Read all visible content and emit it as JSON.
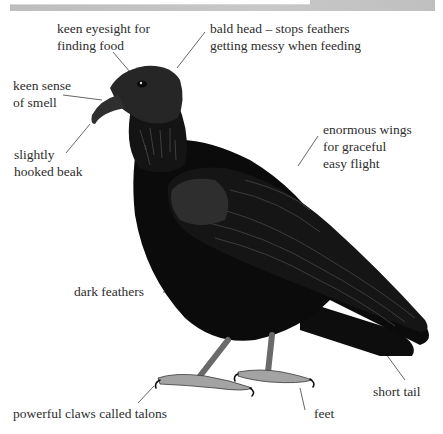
{
  "banner": {
    "title_fragment": "Some Features",
    "background": "#c4c4c4"
  },
  "figure": {
    "labels": {
      "eyesight": [
        "keen eyesight for",
        "finding food"
      ],
      "bald_head": [
        "bald head – stops feathers",
        "getting messy when feeding"
      ],
      "smell": [
        "keen sense",
        "of smell"
      ],
      "beak": [
        "slightly",
        "hooked beak"
      ],
      "wings": [
        "enormous wings",
        "for graceful",
        "easy flight"
      ],
      "feathers": [
        "dark feathers"
      ],
      "tail": [
        "short tail"
      ],
      "talons": [
        "powerful claws called talons"
      ],
      "feet": [
        "feet"
      ]
    },
    "colors": {
      "text": "#2d2d2d",
      "leader_line": "#555555",
      "body": "#0c0c0c",
      "feather_highlight": "#3a3a3a",
      "feet": "#9a9a9a"
    }
  }
}
